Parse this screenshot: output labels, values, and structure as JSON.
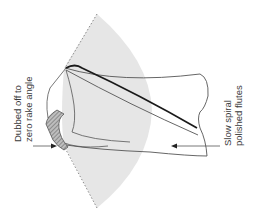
{
  "figure": {
    "type": "technical-illustration",
    "colors": {
      "background": "#ffffff",
      "sector_fill": "#e6e6e6",
      "outline": "#555555",
      "cutting_edge": "#1a1a1a",
      "hatch": "#777777",
      "text": "#3a3a3a"
    }
  },
  "labels": {
    "left": {
      "line1": "Dubbed off to",
      "line2": "zero rake angle"
    },
    "right": {
      "line1": "Slow spiral",
      "line2": "polished flutes"
    }
  }
}
